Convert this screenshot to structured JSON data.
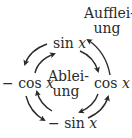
{
  "diagram": {
    "outer_label": {
      "line1": "Aufflei-",
      "line2": "ung"
    },
    "inner_label": {
      "line1": "Ablei-",
      "line2": "ung"
    },
    "nodes": {
      "top": {
        "fn": "sin",
        "var": "x"
      },
      "right": {
        "fn": "cos",
        "var": "x"
      },
      "bottom": {
        "fn": "− sin",
        "var": "x"
      },
      "left": {
        "fn": "− cos",
        "var": "x"
      }
    },
    "inner_cycle_direction": "clockwise",
    "outer_cycle_direction": "counterclockwise",
    "arrow_color": "#2a2a2a"
  }
}
